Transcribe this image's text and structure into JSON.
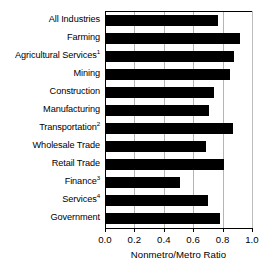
{
  "chart_data": {
    "type": "bar",
    "orientation": "horizontal",
    "title": "",
    "xlabel": "Nonmetro/Metro Ratio",
    "ylabel": "",
    "xlim": [
      0.0,
      1.0
    ],
    "xticks": [
      "0.0",
      "0.2",
      "0.4",
      "0.6",
      "0.8",
      "1.0"
    ],
    "xtick_values": [
      0.0,
      0.2,
      0.4,
      0.6,
      0.8,
      1.0
    ],
    "grid": "vertical",
    "legend": "none",
    "bar_color": "#000000",
    "categories": [
      "All Industries",
      "Farming",
      "Agricultural Services",
      "Mining",
      "Construction",
      "Manufacturing",
      "Transportation",
      "Wholesale Trade",
      "Retail Trade",
      "Finance",
      "Services",
      "Government"
    ],
    "category_footnotes": [
      "",
      "",
      "1",
      "",
      "",
      "",
      "2",
      "",
      "",
      "3",
      "4",
      ""
    ],
    "values": [
      0.77,
      0.92,
      0.88,
      0.85,
      0.74,
      0.71,
      0.87,
      0.69,
      0.81,
      0.51,
      0.7,
      0.78
    ]
  }
}
